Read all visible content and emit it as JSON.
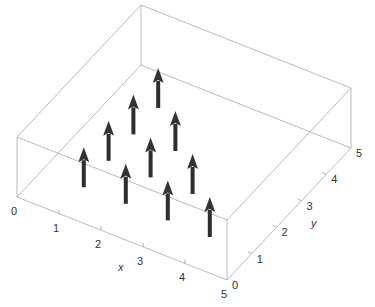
{
  "chart_data": {
    "type": "vector_field_3d",
    "title": "",
    "xlabel": "x",
    "ylabel": "y",
    "zlabel": "",
    "xlim": [
      0,
      5
    ],
    "ylim": [
      0,
      5
    ],
    "x_ticks": [
      "0",
      "1",
      "2",
      "3",
      "4",
      "5"
    ],
    "y_ticks": [
      "0",
      "1",
      "2",
      "3",
      "4",
      "5"
    ],
    "grid": false,
    "box": true,
    "arrow_color": "#333333",
    "box_color": "#a8a8a8",
    "vectors": [
      {
        "x": 1,
        "y": 1,
        "z": 0,
        "u": 0,
        "v": 0,
        "w": 1
      },
      {
        "x": 2,
        "y": 1,
        "z": 0,
        "u": 0,
        "v": 0,
        "w": 1
      },
      {
        "x": 3,
        "y": 1,
        "z": 0,
        "u": 0,
        "v": 0,
        "w": 1
      },
      {
        "x": 4,
        "y": 1,
        "z": 0,
        "u": 0,
        "v": 0,
        "w": 1
      },
      {
        "x": 1,
        "y": 2,
        "z": 0,
        "u": 0,
        "v": 0,
        "w": 1
      },
      {
        "x": 2,
        "y": 2,
        "z": 0,
        "u": 0,
        "v": 0,
        "w": 1
      },
      {
        "x": 3,
        "y": 2,
        "z": 0,
        "u": 0,
        "v": 0,
        "w": 1
      },
      {
        "x": 1,
        "y": 3,
        "z": 0,
        "u": 0,
        "v": 0,
        "w": 1
      },
      {
        "x": 2,
        "y": 3,
        "z": 0,
        "u": 0,
        "v": 0,
        "w": 1
      },
      {
        "x": 1,
        "y": 4,
        "z": 0,
        "u": 0,
        "v": 0,
        "w": 1
      }
    ]
  },
  "labels": {
    "x_axis": "x",
    "y_axis": "y",
    "x_ticks": [
      "0",
      "1",
      "2",
      "3",
      "4",
      "5"
    ],
    "y_ticks": [
      "0",
      "1",
      "2",
      "3",
      "4",
      "5"
    ]
  }
}
